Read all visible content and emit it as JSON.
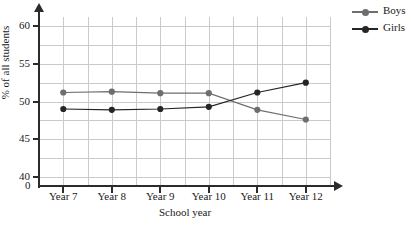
{
  "chart_data": {
    "type": "line",
    "title": "",
    "xlabel": "School year",
    "ylabel": "% of all students",
    "categories": [
      "Year 7",
      "Year 8",
      "Year 9",
      "Year 10",
      "Year 11",
      "Year 12"
    ],
    "ylim": [
      38.75,
      61.25
    ],
    "yticks": [
      40,
      45,
      50,
      55,
      60
    ],
    "ytick_labels": [
      "40",
      "45",
      "50",
      "55",
      "60"
    ],
    "origin_label": "0",
    "axis_break": true,
    "grid": true,
    "minor_gridline_step_y": 2.5,
    "minor_gridlines_x_per_category": 2,
    "legend_position": "top-right-outside",
    "series": [
      {
        "name": "Boys",
        "color": "#6e6e6e",
        "marker": "circle",
        "values": [
          51.2,
          51.3,
          51.1,
          51.1,
          48.9,
          47.6
        ]
      },
      {
        "name": "Girls",
        "color": "#252525",
        "marker": "circle",
        "values": [
          49.0,
          48.9,
          49.0,
          49.3,
          51.2,
          52.5
        ]
      }
    ]
  },
  "legend": {
    "items": [
      {
        "label": "Boys",
        "color": "#6e6e6e"
      },
      {
        "label": "Girls",
        "color": "#252525"
      }
    ]
  },
  "axes": {
    "y_title": "% of all students",
    "x_title": "School year",
    "origin": "0"
  }
}
